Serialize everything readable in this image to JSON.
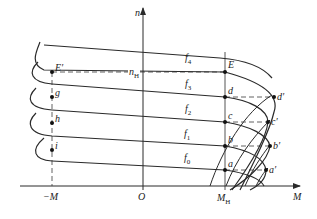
{
  "diagram": {
    "type": "characteristic-curves",
    "axes": {
      "y_label": "n",
      "x_label": "M",
      "origin_label": "O",
      "neg_x_label": "−M",
      "rated_torque_label": "M",
      "rated_torque_sub": "H",
      "rated_speed_label": "n",
      "rated_speed_sub": "H"
    },
    "curves": [
      {
        "id": "f4",
        "label": "f",
        "sub": "4"
      },
      {
        "id": "f3",
        "label": "f",
        "sub": "3"
      },
      {
        "id": "f2",
        "label": "f",
        "sub": "2"
      },
      {
        "id": "f1",
        "label": "f",
        "sub": "1"
      },
      {
        "id": "f0",
        "label": "f",
        "sub": "0"
      }
    ],
    "points_right": [
      {
        "label": "E"
      },
      {
        "label": "d"
      },
      {
        "label": "c"
      },
      {
        "label": "b"
      },
      {
        "label": "a"
      }
    ],
    "points_far_right": [
      {
        "label": "d′"
      },
      {
        "label": "c′"
      },
      {
        "label": "b′"
      },
      {
        "label": "a′"
      }
    ],
    "points_left": [
      {
        "label": "E′"
      },
      {
        "label": "g"
      },
      {
        "label": "h"
      },
      {
        "label": "i"
      }
    ],
    "colors": {
      "line": "#2a2a2a",
      "dash": "#3a3a3a",
      "background": "#ffffff"
    }
  }
}
